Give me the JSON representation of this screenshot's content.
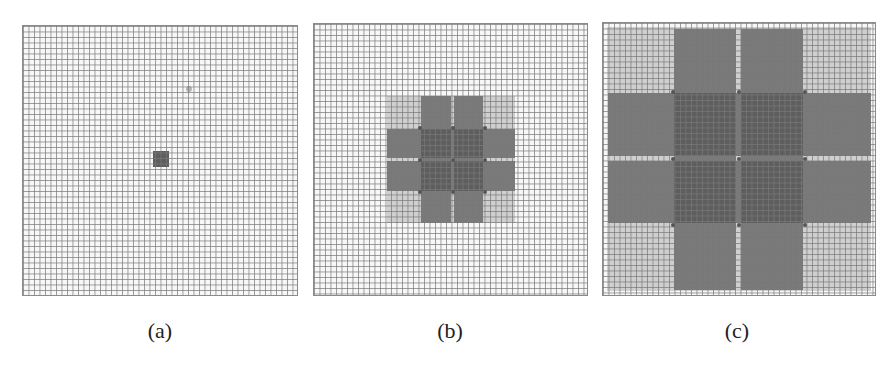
{
  "figure": {
    "panels": [
      {
        "id": "a",
        "label": "(a)",
        "description": "Single small active cell cluster at grid center"
      },
      {
        "id": "b",
        "label": "(b)",
        "description": "Cross-shaped expanded region of medium size"
      },
      {
        "id": "c",
        "label": "(c)",
        "description": "Cross-shaped region expanded to fill the whole grid"
      }
    ]
  },
  "colors": {
    "grid_line": "#787878",
    "background": "#f7f7f7",
    "light_region": "#cfcfcf",
    "dark_region": "#7a7a7a",
    "overlap_region": "#5e5e5e"
  }
}
